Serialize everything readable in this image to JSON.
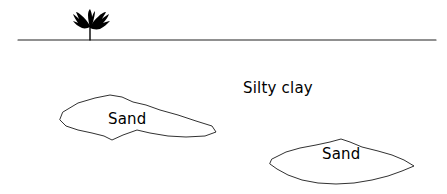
{
  "figure": {
    "background_color": "#ffffff",
    "line_color": "#1a1a1a",
    "text_color": "#000000",
    "width": 447,
    "height": 194
  },
  "ground": {
    "name": "ground-surface-line",
    "x_start": 18,
    "x_end": 436,
    "y": 40
  },
  "vegetation": {
    "name": "shrub",
    "icon": "plant-shrub-icon",
    "base_x": 90,
    "base_y": 40,
    "top_y": 10
  },
  "labels": {
    "silty_clay": "Silty clay",
    "sand_left": "Sand",
    "sand_right": "Sand"
  },
  "label_positions": {
    "silty_clay": {
      "x": 243,
      "y": 93
    },
    "sand_left": {
      "x": 108,
      "y": 124
    },
    "sand_right": {
      "x": 322,
      "y": 159
    }
  },
  "lenses": [
    {
      "name": "sand-lens-left",
      "label": "Sand",
      "points": "63,112 78,103 95,98 110,95 122,97 133,102 146,105 160,110 178,115 196,121 212,126 216,132 205,136 186,137 168,136 150,133 137,130 123,135 112,140 104,136 92,133 78,130 66,126 60,120"
    },
    {
      "name": "sand-lens-right",
      "label": "Sand",
      "points": "272,159 286,152 300,148 316,145 330,142 341,139 350,142 362,147 378,151 392,155 404,160 414,166 402,171 388,176 372,180 354,183 336,184 318,183 302,180 288,175 277,169 270,164"
    }
  ]
}
